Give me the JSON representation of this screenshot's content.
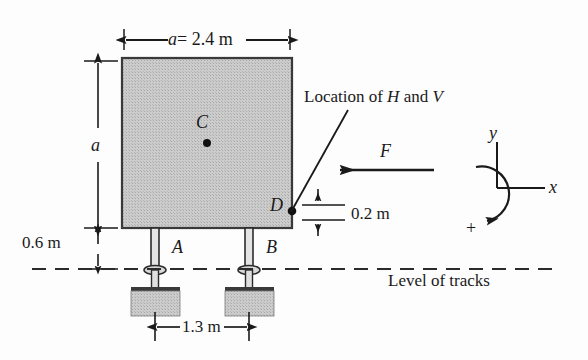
{
  "figure": {
    "background_color": "#fdfdfd",
    "ink_color": "#1a1a1a",
    "block_fill_color": "#c9c9c9"
  },
  "labels": {
    "top_dimension": "a = 2.4 m",
    "top_dimension_symbol": "a",
    "top_dimension_value": "= 2.4 m",
    "left_dimension_a": "a",
    "left_dimension_clearance": "0.6 m",
    "bottom_dimension": "1.3 m",
    "offset_dimension": "0.2 m",
    "centroid": "C",
    "point_d": "D",
    "support_a": "A",
    "support_b": "B",
    "force": "F",
    "callout": "Location of H and V",
    "track_level": "Level of tracks",
    "axis_x": "x",
    "axis_y": "y",
    "axis_positive": "+"
  },
  "geometry": {
    "block": {
      "x": 122,
      "y": 58,
      "width": 170,
      "height": 170
    },
    "centroid_point": {
      "x": 207,
      "y": 143
    },
    "point_d": {
      "x": 291,
      "y": 211
    },
    "track_line_y": 269,
    "support_a_x": 155,
    "support_b_x": 249,
    "axis_origin": {
      "x": 497,
      "y": 188
    }
  },
  "values": {
    "a_meters": 2.4,
    "clearance_meters": 0.6,
    "track_gauge_meters": 1.3,
    "d_offset_meters": 0.2
  }
}
